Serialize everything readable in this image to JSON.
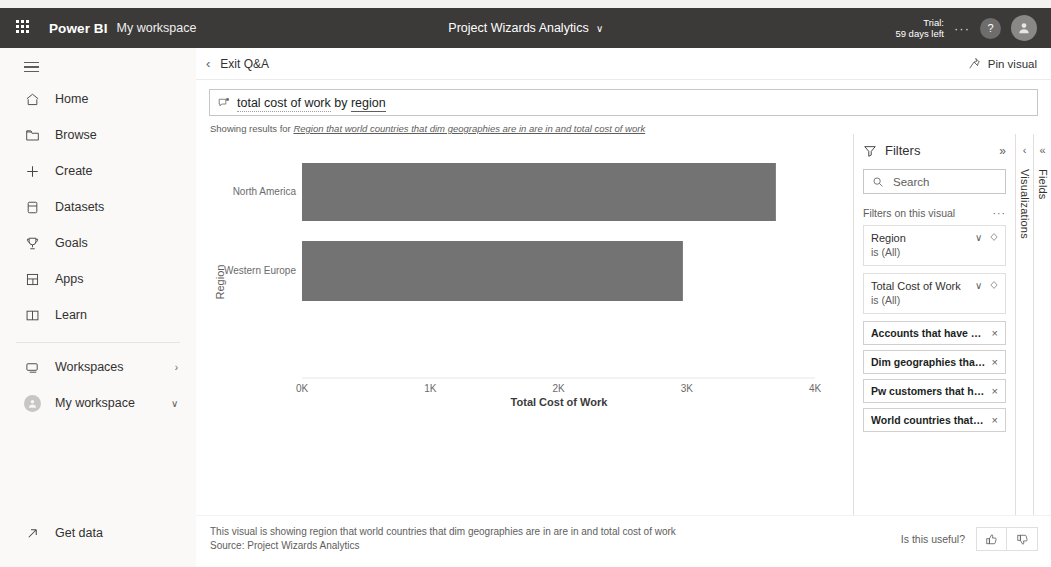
{
  "topbar": {
    "waffle_icon": "app-launcher-icon",
    "brand": "Power BI",
    "workspace": "My workspace",
    "report_title": "Project Wizards Analytics",
    "chevron": "∨",
    "ellipsis": "···",
    "trial_line1": "Trial:",
    "trial_line2": "59 days left",
    "help_icon": "?",
    "avatar_icon": "user-avatar-icon"
  },
  "sidebar": {
    "toggle_icon": "hamburger-icon",
    "items": [
      {
        "label": "Home",
        "icon": "home-icon"
      },
      {
        "label": "Browse",
        "icon": "browse-folder-icon"
      },
      {
        "label": "Create",
        "icon": "plus-icon"
      },
      {
        "label": "Datasets",
        "icon": "dataset-icon"
      },
      {
        "label": "Goals",
        "icon": "goals-trophy-icon"
      },
      {
        "label": "Apps",
        "icon": "apps-icon"
      },
      {
        "label": "Learn",
        "icon": "learn-book-icon"
      }
    ],
    "workspaces": {
      "label": "Workspaces",
      "icon": "workspaces-icon",
      "arrow": "›"
    },
    "my_workspace": {
      "label": "My workspace",
      "icon": "workspace-avatar-icon",
      "arrow": "∨"
    },
    "get_data": {
      "label": "Get data",
      "icon": "get-data-arrow-icon"
    }
  },
  "qna": {
    "exit_label": "Exit Q&A",
    "back_chevron": "‹",
    "pin_label": "Pin visual",
    "pin_icon": "pin-icon",
    "question_icon": "qna-icon",
    "question_part1": "total cost of work",
    "question_part2": " by ",
    "question_part3": "region",
    "showing_prefix": "Showing results for ",
    "showing_phrase": "Region that world countries that dim geographies are in are in and total cost of work"
  },
  "chart_data": {
    "type": "bar",
    "orientation": "horizontal",
    "title": "",
    "categories": [
      "North America",
      "Western Europe"
    ],
    "values": [
      3695,
      2970
    ],
    "xlabel": "Total Cost of Work",
    "ylabel": "Region",
    "xlim": [
      0,
      4000
    ],
    "xticks": [
      0,
      1000,
      2000,
      3000,
      4000
    ],
    "xticklabels": [
      "0K",
      "1K",
      "2K",
      "3K",
      "4K"
    ],
    "grid": false,
    "legend": false,
    "bar_color": "#737373",
    "axis_color": "#d9d9d9",
    "tick_label_color": "#6b6b6b"
  },
  "filters": {
    "title": "Filters",
    "filter_icon": "filter-funnel-icon",
    "expand_icon": "»",
    "search_icon": "search-icon",
    "search_placeholder": "Search",
    "section_label": "Filters on this visual",
    "section_menu": "···",
    "cards": [
      {
        "name": "Region",
        "value": "is (All)",
        "chevron": "∨",
        "eye_icon": "hide-filter-icon"
      },
      {
        "name": "Total Cost of Work",
        "value": "is (All)",
        "chevron": "∨",
        "eye_icon": "hide-filter-icon"
      }
    ],
    "pills": [
      {
        "label": "Accounts that have dim ...",
        "close": "×"
      },
      {
        "label": "Dim geographies that ha...",
        "close": "×"
      },
      {
        "label": "Pw customers that have ...",
        "close": "×"
      },
      {
        "label": "World countries that dim...",
        "close": "×"
      }
    ]
  },
  "rails": {
    "visualizations": {
      "label": "Visualizations",
      "chevron": "‹"
    },
    "fields": {
      "label": "Fields",
      "chevron": "«"
    }
  },
  "footer": {
    "line1": "This visual is showing region that world countries that dim geographies are in are in and total cost of work",
    "line2": "Source: Project Wizards Analytics",
    "useful_label": "Is this useful?",
    "thumbs_up_icon": "thumbs-up-icon",
    "thumbs_down_icon": "thumbs-down-icon"
  }
}
